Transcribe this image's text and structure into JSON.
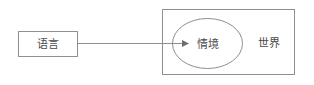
{
  "diagram": {
    "type": "block-diagram",
    "canvas": {
      "width": 314,
      "height": 85,
      "background": "#ffffff"
    },
    "style": {
      "stroke_color": "#8f8f8f",
      "text_color": "#4a4a4a",
      "arrow_color": "#6e6e6e",
      "stroke_width": 1
    },
    "nodes": {
      "language_box": {
        "label": "语言",
        "shape": "rectangle",
        "x": 18,
        "y": 31,
        "width": 60,
        "height": 26
      },
      "world_box": {
        "label": "世界",
        "shape": "rectangle",
        "x": 162,
        "y": 9,
        "width": 133,
        "height": 66,
        "label_x": 269,
        "label_y": 43
      },
      "context_ellipse": {
        "label": "情境",
        "shape": "ellipse",
        "cx": 207,
        "cy": 43,
        "rx": 35,
        "ry": 25
      }
    },
    "edges": [
      {
        "name": "language-to-context",
        "from": "language_box",
        "to": "context_ellipse",
        "x1": 78,
        "y1": 43.5,
        "x2": 184,
        "y2": 43.5,
        "arrowhead": "filled-triangle"
      }
    ]
  }
}
